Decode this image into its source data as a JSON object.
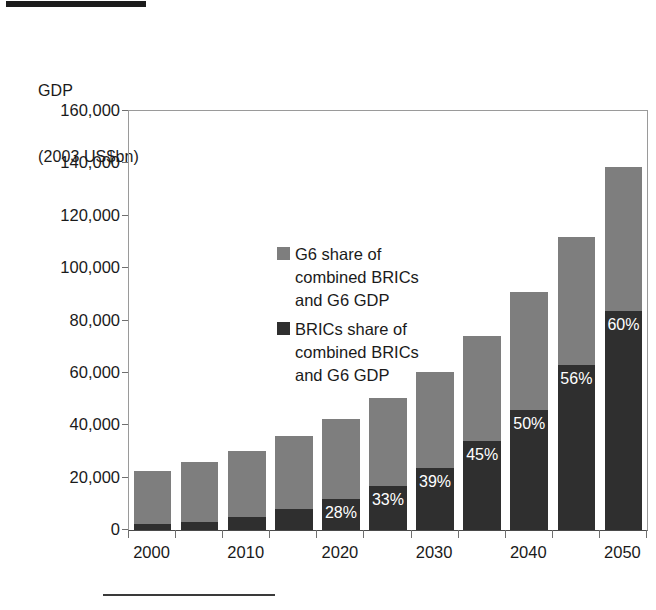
{
  "figure": {
    "top_rule": "black-header-bar",
    "bottom_rule": "footnote-separator-rule"
  },
  "axis_title": {
    "line1": "GDP",
    "line2": "(2003 US$bn)"
  },
  "legend": {
    "position": "inside-top-left",
    "entries": [
      {
        "key": "g6",
        "label": "G6 share of\ncombined BRICs\nand G6 GDP",
        "color": "#7e7e7e"
      },
      {
        "key": "brics",
        "label": "BRICs share of\ncombined BRICs\nand G6 GDP",
        "color": "#2f2f2f"
      }
    ]
  },
  "chart_data": {
    "type": "bar",
    "subtype": "stacked-vertical",
    "title": "",
    "subtitle": "",
    "xlabel": "",
    "ylabel": "GDP (2003 US$bn)",
    "grid": false,
    "ylim": [
      0,
      160000
    ],
    "ytick_step": 20000,
    "ytick_labels": [
      "0",
      "20,000",
      "40,000",
      "60,000",
      "80,000",
      "100,000",
      "120,000",
      "140,000",
      "160,000"
    ],
    "ytick_values": [
      0,
      20000,
      40000,
      60000,
      80000,
      100000,
      120000,
      140000,
      160000
    ],
    "x": [
      2000,
      2005,
      2010,
      2015,
      2020,
      2025,
      2030,
      2035,
      2040,
      2045,
      2050
    ],
    "xtick_labels": [
      "2000",
      "2010",
      "2020",
      "2030",
      "2040",
      "2050"
    ],
    "xtick_label_values": [
      2000,
      2010,
      2020,
      2030,
      2040,
      2050
    ],
    "series": [
      {
        "name": "BRICs share of combined BRICs and G6 GDP",
        "key": "brics",
        "color": "#2f2f2f",
        "values": [
          2200,
          3000,
          4800,
          8200,
          12000,
          16900,
          23800,
          34000,
          46000,
          63000,
          83500
        ]
      },
      {
        "name": "G6 share of combined BRICs and G6 GDP",
        "key": "g6",
        "color": "#7e7e7e",
        "values": [
          20300,
          23000,
          25200,
          27800,
          30500,
          33600,
          36700,
          40000,
          45000,
          49000,
          55000
        ]
      }
    ],
    "totals": [
      22500,
      26000,
      30000,
      36000,
      42500,
      50500,
      60500,
      74000,
      91000,
      112000,
      138500
    ],
    "annotations": [
      {
        "x": 2020,
        "text": "28%",
        "series": "brics"
      },
      {
        "x": 2025,
        "text": "33%",
        "series": "brics"
      },
      {
        "x": 2030,
        "text": "39%",
        "series": "brics"
      },
      {
        "x": 2035,
        "text": "45%",
        "series": "brics"
      },
      {
        "x": 2040,
        "text": "50%",
        "series": "brics"
      },
      {
        "x": 2045,
        "text": "56%",
        "series": "brics"
      },
      {
        "x": 2050,
        "text": "60%",
        "series": "brics"
      }
    ]
  }
}
